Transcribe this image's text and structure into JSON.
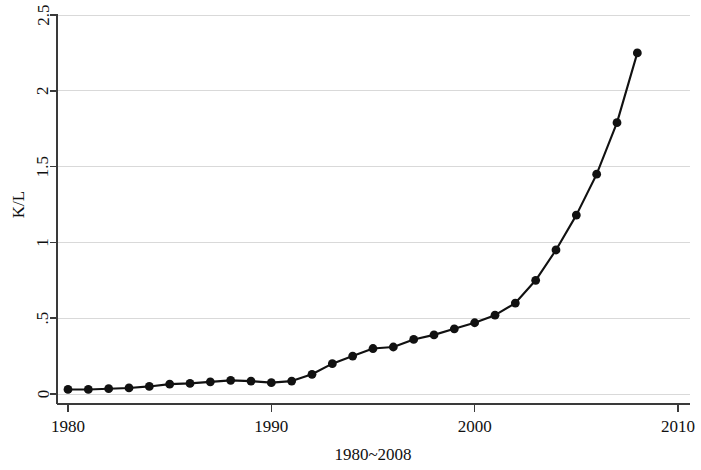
{
  "chart_data": {
    "type": "line",
    "title": "",
    "subtitle": "",
    "xlabel": "1980~2008",
    "ylabel": "K/L",
    "xlim": [
      1980,
      2010
    ],
    "ylim": [
      0,
      2.5
    ],
    "grid": true,
    "legend": null,
    "x_ticks": [
      "1980",
      "1990",
      "2000",
      "2010"
    ],
    "x_tick_values": [
      1980,
      1990,
      2000,
      2010
    ],
    "y_ticks": [
      "0",
      ".5",
      "1",
      "1.5",
      "2",
      "2.5"
    ],
    "y_tick_values": [
      0,
      0.5,
      1,
      1.5,
      2,
      2.5
    ],
    "marker": "filled-circle",
    "line_color": "#111111",
    "grid_color": "#d9d9d9",
    "axis_color": "#3a3a3a",
    "x": [
      1980,
      1981,
      1982,
      1983,
      1984,
      1985,
      1986,
      1987,
      1988,
      1989,
      1990,
      1991,
      1992,
      1993,
      1994,
      1995,
      1996,
      1997,
      1998,
      1999,
      2000,
      2001,
      2002,
      2003,
      2004,
      2005,
      2006,
      2007,
      2008
    ],
    "values": [
      0.03,
      0.03,
      0.035,
      0.04,
      0.05,
      0.065,
      0.07,
      0.08,
      0.09,
      0.085,
      0.075,
      0.085,
      0.13,
      0.2,
      0.25,
      0.3,
      0.31,
      0.36,
      0.39,
      0.43,
      0.47,
      0.52,
      0.6,
      0.75,
      0.95,
      1.18,
      1.45,
      1.79,
      2.25
    ],
    "series": [
      {
        "name": "K/L",
        "values": [
          0.03,
          0.03,
          0.035,
          0.04,
          0.05,
          0.065,
          0.07,
          0.08,
          0.09,
          0.085,
          0.075,
          0.085,
          0.13,
          0.2,
          0.25,
          0.3,
          0.31,
          0.36,
          0.39,
          0.43,
          0.47,
          0.52,
          0.6,
          0.75,
          0.95,
          1.18,
          1.45,
          1.79,
          2.25
        ]
      }
    ]
  }
}
